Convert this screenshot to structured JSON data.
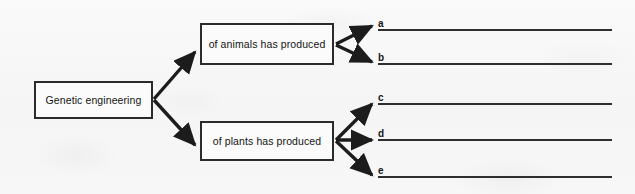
{
  "diagram": {
    "type": "tree-concept-map",
    "background_color": "#f7f7f7",
    "stroke_color": "#2b2b2b",
    "root": {
      "label": "Genetic engineering"
    },
    "branches": [
      {
        "id": "animals",
        "label": "of animals has produced",
        "answers": [
          "a",
          "b"
        ]
      },
      {
        "id": "plants",
        "label": "of plants has produced",
        "answers": [
          "c",
          "d",
          "e"
        ]
      }
    ],
    "answer_lines": [
      {
        "label": "a",
        "value": ""
      },
      {
        "label": "b",
        "value": ""
      },
      {
        "label": "c",
        "value": ""
      },
      {
        "label": "d",
        "value": ""
      },
      {
        "label": "e",
        "value": ""
      }
    ]
  }
}
